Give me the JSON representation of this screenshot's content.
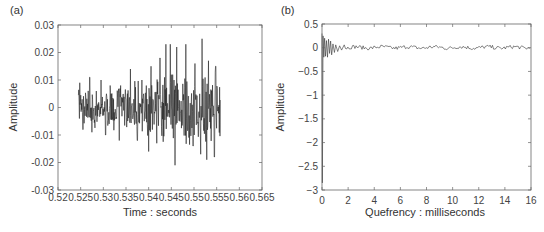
{
  "chart_data": [
    {
      "panel": "(a)",
      "type": "line",
      "title": "",
      "xlabel": "Time : seconds",
      "ylabel": "Amplitude",
      "xlim": [
        0.52,
        0.565
      ],
      "ylim": [
        -0.03,
        0.03
      ],
      "xticks": [
        0.52,
        0.525,
        0.53,
        0.535,
        0.54,
        0.545,
        0.55,
        0.555,
        0.56,
        0.565
      ],
      "xtick_labels": [
        "0.52",
        "0.525",
        "0.53",
        "0.535",
        "0.54",
        "0.545",
        "0.55",
        "0.555",
        "0.56",
        "0.565"
      ],
      "yticks": [
        0.03,
        0.02,
        0.01,
        0,
        -0.01,
        -0.02,
        -0.03
      ],
      "ytick_labels": [
        "0.03",
        "0.02",
        "0.01",
        "0",
        "-0.01",
        "-0.02",
        "-0.03"
      ],
      "grid": false,
      "series": [
        {
          "name": "speech segment",
          "x_start": 0.5245,
          "x_end": 0.5558,
          "description": "noisy voiced waveform; amplitude roughly ±0.01 from 0.5245–0.535 s, growing to peaks of ~+0.023/+0.025 and troughs of ~-0.021 between 0.543–0.555 s",
          "peaks": [
            {
              "x": 0.5248,
              "y": 0.009
            },
            {
              "x": 0.527,
              "y": 0.011
            },
            {
              "x": 0.5295,
              "y": 0.01
            },
            {
              "x": 0.5315,
              "y": 0.008
            },
            {
              "x": 0.536,
              "y": 0.014
            },
            {
              "x": 0.5385,
              "y": 0.01
            },
            {
              "x": 0.5405,
              "y": 0.015
            },
            {
              "x": 0.5425,
              "y": 0.018
            },
            {
              "x": 0.5438,
              "y": 0.023
            },
            {
              "x": 0.5448,
              "y": 0.023
            },
            {
              "x": 0.5462,
              "y": 0.022
            },
            {
              "x": 0.5482,
              "y": 0.023
            },
            {
              "x": 0.5502,
              "y": 0.016
            },
            {
              "x": 0.5518,
              "y": 0.025
            },
            {
              "x": 0.5532,
              "y": 0.017
            },
            {
              "x": 0.5548,
              "y": 0.015
            }
          ],
          "troughs": [
            {
              "x": 0.5255,
              "y": -0.008
            },
            {
              "x": 0.5275,
              "y": -0.009
            },
            {
              "x": 0.5305,
              "y": -0.01
            },
            {
              "x": 0.5335,
              "y": -0.012
            },
            {
              "x": 0.5375,
              "y": -0.012
            },
            {
              "x": 0.54,
              "y": -0.016
            },
            {
              "x": 0.5418,
              "y": -0.013
            },
            {
              "x": 0.5458,
              "y": -0.021
            },
            {
              "x": 0.5498,
              "y": -0.014
            },
            {
              "x": 0.5515,
              "y": -0.017
            },
            {
              "x": 0.5528,
              "y": -0.019
            },
            {
              "x": 0.5545,
              "y": -0.018
            }
          ]
        }
      ]
    },
    {
      "panel": "(b)",
      "type": "line",
      "title": "",
      "xlabel": "Quefrency : milliseconds",
      "ylabel": "Amplitude",
      "xlim": [
        0,
        16
      ],
      "ylim": [
        -3,
        0.5
      ],
      "xticks": [
        0,
        2,
        4,
        6,
        8,
        10,
        12,
        14,
        16
      ],
      "xtick_labels": [
        "0",
        "2",
        "4",
        "6",
        "8",
        "10",
        "12",
        "14",
        "16"
      ],
      "yticks": [
        0.5,
        0,
        -0.5,
        -1,
        -1.5,
        -2,
        -2.5,
        -3
      ],
      "ytick_labels": [
        "0.5",
        "0",
        "−0.5",
        "−1",
        "−1.5",
        "−2",
        "−2.5",
        "−3"
      ],
      "grid": false,
      "series": [
        {
          "name": "cepstrum",
          "description": "large negative spike to ~-2.85 at 0 ms, initial spike ~+0.3, decaying oscillation ±0.15 until ~1.5 ms, then small ripple ≈ ±0.05 around 0 out to 16 ms",
          "key_points": [
            {
              "x": 0.0,
              "y": 0.3
            },
            {
              "x": 0.05,
              "y": -2.85
            },
            {
              "x": 0.15,
              "y": 0.2
            },
            {
              "x": 0.3,
              "y": -0.15
            },
            {
              "x": 0.5,
              "y": 0.15
            },
            {
              "x": 0.7,
              "y": -0.15
            },
            {
              "x": 1.0,
              "y": 0.08
            },
            {
              "x": 1.5,
              "y": -0.05
            },
            {
              "x": 2,
              "y": 0.02
            },
            {
              "x": 4,
              "y": 0.0
            },
            {
              "x": 8,
              "y": 0.02
            },
            {
              "x": 12,
              "y": 0.02
            },
            {
              "x": 16,
              "y": 0.0
            }
          ]
        }
      ]
    }
  ]
}
